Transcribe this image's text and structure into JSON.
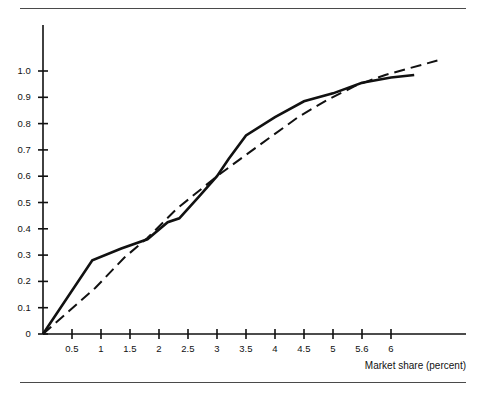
{
  "figure": {
    "background_color": "#ffffff",
    "ink_color": "#111111",
    "rule_color": "#4a4a4a",
    "rules": [
      "top",
      "bottom"
    ]
  },
  "axis_title": {
    "x": "Market share (percent)"
  },
  "chart_data": {
    "type": "line",
    "title": "",
    "subtitle": "",
    "xlabel": "Market share (percent)",
    "ylabel": "",
    "xlim": [
      0,
      6.9
    ],
    "ylim": [
      0,
      1.1
    ],
    "grid": false,
    "legend": null,
    "x_tick_labels": [
      "0.5",
      "1",
      "1.5",
      "2",
      "2.5",
      "3",
      "3.5",
      "4",
      "4.5",
      "5",
      "5.6",
      "6"
    ],
    "x_tick_values": [
      0.5,
      1,
      1.5,
      2,
      2.5,
      3,
      3.5,
      4,
      4.5,
      5,
      5.5,
      6
    ],
    "y_tick_labels": [
      "0",
      "0.1",
      "0.2",
      "0.3",
      "0.4",
      "0.5",
      "0.6",
      "0.7",
      "0.8",
      "0.9",
      "1.0"
    ],
    "y_tick_values": [
      0,
      0.1,
      0.2,
      0.3,
      0.4,
      0.5,
      0.6,
      0.7,
      0.8,
      0.9,
      1.0
    ],
    "series": [
      {
        "name": "observed-curve",
        "style": "solid",
        "color": "#111111",
        "width": 2.6,
        "points": [
          [
            0.0,
            0.0
          ],
          [
            0.85,
            0.28
          ],
          [
            1.35,
            0.325
          ],
          [
            1.8,
            0.36
          ],
          [
            2.15,
            0.425
          ],
          [
            2.35,
            0.44
          ],
          [
            2.7,
            0.525
          ],
          [
            3.0,
            0.6
          ],
          [
            3.2,
            0.665
          ],
          [
            3.5,
            0.755
          ],
          [
            4.0,
            0.825
          ],
          [
            4.5,
            0.885
          ],
          [
            5.0,
            0.915
          ],
          [
            5.5,
            0.955
          ],
          [
            6.0,
            0.975
          ],
          [
            6.4,
            0.985
          ]
        ]
      },
      {
        "name": "reference-curve",
        "style": "dashed",
        "color": "#111111",
        "width": 2.0,
        "dash_pattern": "11 6",
        "points": [
          [
            0.0,
            0.0
          ],
          [
            0.9,
            0.175
          ],
          [
            1.4,
            0.29
          ],
          [
            1.8,
            0.365
          ],
          [
            2.3,
            0.475
          ],
          [
            2.75,
            0.555
          ],
          [
            3.0,
            0.6
          ],
          [
            3.4,
            0.665
          ],
          [
            3.9,
            0.745
          ],
          [
            4.4,
            0.825
          ],
          [
            4.9,
            0.89
          ],
          [
            5.4,
            0.945
          ],
          [
            5.9,
            0.985
          ],
          [
            6.8,
            1.04
          ]
        ]
      }
    ]
  }
}
